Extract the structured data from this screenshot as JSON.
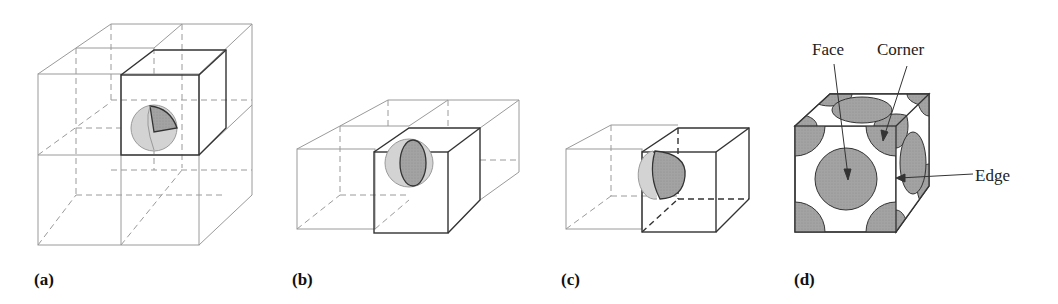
{
  "figure": {
    "panels": [
      {
        "id": "a",
        "label": "(a)",
        "description": "Atom at corner shared by 8 unit cells"
      },
      {
        "id": "b",
        "label": "(b)",
        "description": "Atom at edge shared by 4 unit cells"
      },
      {
        "id": "c",
        "label": "(c)",
        "description": "Atom at face shared by 2 unit cells"
      },
      {
        "id": "d",
        "label": "(d)",
        "description": "Face-centered cubic unit cell with packed spheres"
      }
    ],
    "annotations": {
      "face": "Face",
      "corner": "Corner",
      "edge": "Edge"
    },
    "colors": {
      "line_light": "#8a8a8a",
      "line_dark": "#222222",
      "sphere_fill": "#a9a9a9",
      "sphere_light": "#d0d0d0",
      "background": "#ffffff"
    }
  }
}
